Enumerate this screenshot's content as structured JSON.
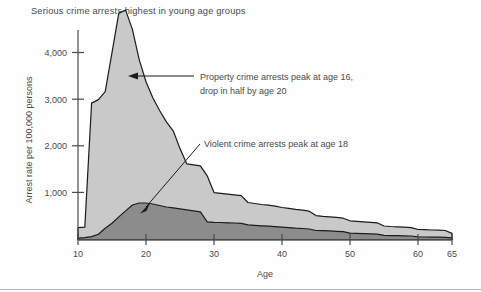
{
  "figure": {
    "title": "Serious crime arrests highest in young age groups"
  },
  "chart_data": {
    "type": "area",
    "title": "Serious crime arrests highest in young age groups",
    "xlabel": "Age",
    "ylabel": "Arrest rate per 100,000 persons",
    "xlim": [
      10,
      65
    ],
    "ylim": [
      0,
      4400
    ],
    "xticks": [
      10,
      20,
      30,
      40,
      50,
      60,
      65
    ],
    "xtick_labels": [
      "10",
      "20",
      "30",
      "40",
      "50",
      "60",
      "65"
    ],
    "yticks": [
      1000,
      2000,
      3000,
      4000
    ],
    "ytick_labels": [
      "1,000",
      "2,000",
      "3,000",
      "4,000"
    ],
    "grid": false,
    "legend": "none",
    "stacked": true,
    "colors": {
      "property_fill": "#c9c9c9",
      "violent_fill": "#8c8c8c",
      "outline": "#1c1c1c",
      "axis": "#4a4a4a",
      "background": "#fefefe"
    },
    "x": [
      10,
      11,
      12,
      13,
      14,
      15,
      16,
      17,
      18,
      19,
      20,
      21,
      22,
      23,
      24,
      25,
      26,
      27,
      28,
      29,
      30,
      31,
      32,
      33,
      34,
      35,
      36,
      37,
      38,
      39,
      40,
      41,
      42,
      43,
      44,
      45,
      46,
      47,
      48,
      49,
      50,
      51,
      52,
      53,
      54,
      55,
      56,
      57,
      58,
      59,
      60,
      61,
      62,
      63,
      64,
      65
    ],
    "series": [
      {
        "name": "Violent crime arrests",
        "fill": "#8c8c8c",
        "values": [
          30,
          40,
          60,
          110,
          230,
          330,
          460,
          580,
          700,
          740,
          740,
          720,
          690,
          660,
          640,
          620,
          600,
          580,
          560,
          360,
          350,
          345,
          340,
          335,
          330,
          300,
          290,
          280,
          270,
          260,
          250,
          240,
          230,
          225,
          215,
          185,
          180,
          175,
          168,
          160,
          130,
          125,
          120,
          115,
          110,
          85,
          80,
          78,
          75,
          72,
          55,
          52,
          50,
          48,
          45,
          35
        ]
      },
      {
        "name": "Property crime arrests",
        "fill": "#c9c9c9",
        "values": [
          210,
          210,
          2700,
          2720,
          2760,
          3450,
          4120,
          4060,
          3550,
          2900,
          2450,
          2150,
          1920,
          1720,
          1560,
          1220,
          930,
          930,
          930,
          930,
          600,
          590,
          580,
          570,
          560,
          450,
          440,
          430,
          425,
          415,
          400,
          390,
          380,
          370,
          360,
          300,
          290,
          285,
          280,
          272,
          250,
          245,
          240,
          235,
          230,
          190,
          185,
          180,
          175,
          170,
          150,
          148,
          145,
          142,
          140,
          90
        ]
      }
    ],
    "annotations": [
      {
        "id": "property-annotation",
        "text_lines": [
          "Property crime arrests peak at age 16,",
          "drop in half by age 20"
        ],
        "points_to": {
          "age": 17,
          "rate": 3600
        },
        "arrow": "left"
      },
      {
        "id": "violent-annotation",
        "text_lines": [
          "Violent crime arrests peak at age 18"
        ],
        "points_to": {
          "age": 18,
          "rate": 760
        },
        "arrow": "down-left"
      }
    ]
  }
}
